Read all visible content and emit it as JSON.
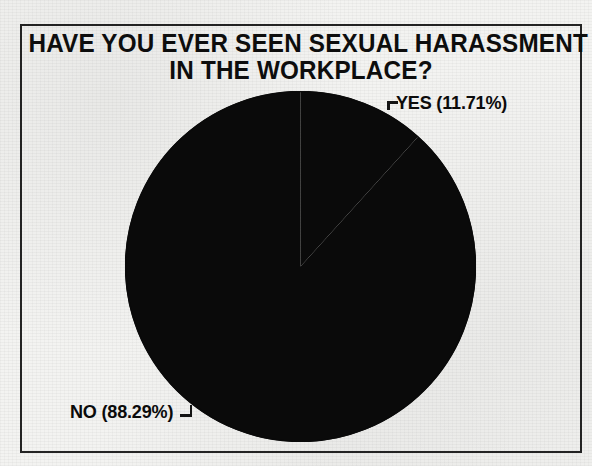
{
  "figure": {
    "background_color": "#f3f3f1",
    "frame_color": "#242424",
    "ink_color": "#0d0d0d"
  },
  "title": {
    "line1": "HAVE YOU EVER SEEN SEXUAL HARASSMENT",
    "line2": "IN THE WORKPLACE?"
  },
  "labels": {
    "yes": "YES (11.71%)",
    "no": "NO (88.29%)"
  },
  "chart_data": {
    "type": "pie",
    "title": "HAVE YOU EVER SEEN SEXUAL HARASSMENT IN THE WORKPLACE?",
    "xlabel": "",
    "ylabel": "",
    "categories": [
      "YES",
      "NO"
    ],
    "values": [
      11.71,
      88.29
    ],
    "value_unit": "percent",
    "slices": [
      {
        "label": "YES",
        "value": 11.71,
        "display_label": "YES (11.71%)",
        "color": "#0a0a0a",
        "start_angle_deg": 0,
        "end_angle_deg": 42.156,
        "callout_position": "top-right"
      },
      {
        "label": "NO",
        "value": 88.29,
        "display_label": "NO (88.29%)",
        "color": "#0a0a0a",
        "start_angle_deg": 42.156,
        "end_angle_deg": 360,
        "callout_position": "bottom-left"
      }
    ],
    "start_angle_deg": 0,
    "direction": "clockwise",
    "grid": false,
    "legend": "callout-labels"
  }
}
